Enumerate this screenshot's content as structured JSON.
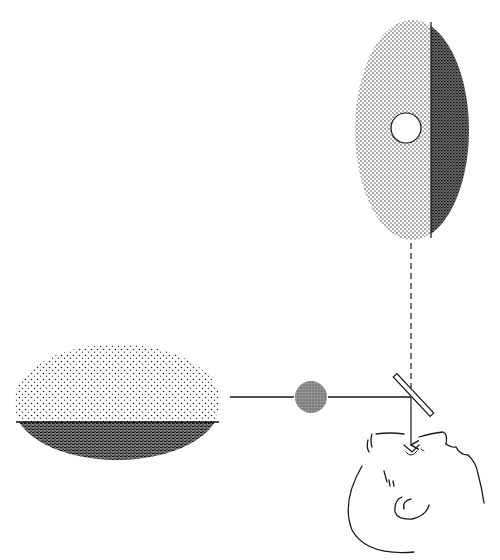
{
  "diagram": {
    "type": "optical-apparatus-illustration",
    "background": "#ffffff",
    "ink": "#1a1a1a",
    "elements": {
      "vertical_field": {
        "shape": "vertical-oval",
        "center": [
          412,
          130
        ],
        "radii": [
          57,
          110
        ],
        "split_x": 431,
        "left_half": "light-stipple",
        "right_half": "dark-stipple",
        "aperture": {
          "center": [
            406,
            128
          ],
          "radius": 15,
          "fill": "#ffffff"
        }
      },
      "horizontal_field": {
        "shape": "horizontal-oval",
        "center": [
          117,
          402
        ],
        "radii": [
          103,
          58
        ],
        "split_y": 422,
        "top_half": "light-stipple",
        "bottom_half": "dark-stipple"
      },
      "grey_sphere": {
        "center": [
          311,
          397
        ],
        "radius": 16,
        "fill": "#8a8a8a"
      },
      "beam_horizontal": {
        "from": [
          230,
          397
        ],
        "to": [
          411,
          397
        ],
        "style": "solid"
      },
      "beam_vertical_dashed": {
        "from": [
          411,
          243
        ],
        "to": [
          411,
          397
        ],
        "style": "dashed"
      },
      "beam_to_eye": {
        "from": [
          411,
          397
        ],
        "to": [
          411,
          446
        ],
        "style": "solid-arrow"
      },
      "half_silvered_mirror": {
        "from": [
          396,
          376
        ],
        "to": [
          431,
          414
        ],
        "angle_deg": 45
      },
      "observer_head": {
        "pose": "reclined-face-up",
        "eye": [
          411,
          450
        ]
      }
    }
  }
}
